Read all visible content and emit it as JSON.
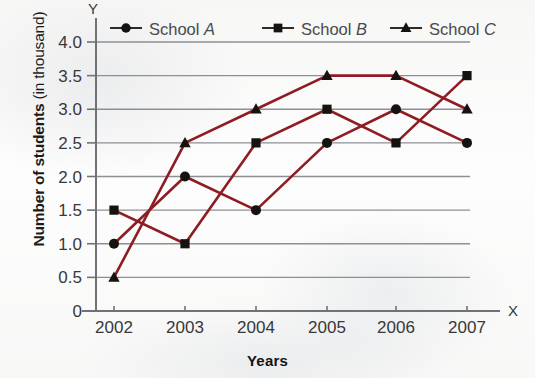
{
  "chart_data": {
    "type": "line",
    "title": "",
    "xlabel": "Years",
    "ylabel": "Number of students (in thousand)",
    "ylabel_bold_part": "Number of students",
    "ylabel_regular_part": "(in thousand)",
    "axis_letter_x": "X",
    "axis_letter_y": "Y",
    "categories": [
      "2002",
      "2003",
      "2004",
      "2005",
      "2006",
      "2007"
    ],
    "x": [
      2002,
      2003,
      2004,
      2005,
      2006,
      2007
    ],
    "ylim": [
      0,
      4.0
    ],
    "yticks": [
      0,
      0.5,
      1.0,
      1.5,
      2.0,
      2.5,
      3.0,
      3.5,
      4.0
    ],
    "ytick_labels": [
      "0",
      "0.5",
      "1.0",
      "1.5",
      "2.0",
      "2.5",
      "3.0",
      "3.5",
      "4.0"
    ],
    "grid": true,
    "grid_axis": "y",
    "legend_position": "top",
    "series": [
      {
        "name": "School A",
        "name_prefix": "School ",
        "name_italic": "A",
        "marker": "circle",
        "values": [
          1.0,
          2.0,
          1.5,
          2.5,
          3.0,
          2.5
        ]
      },
      {
        "name": "School B",
        "name_prefix": "School ",
        "name_italic": "B",
        "marker": "square",
        "values": [
          1.5,
          1.0,
          2.5,
          3.0,
          2.5,
          3.5
        ]
      },
      {
        "name": "School C",
        "name_prefix": "School ",
        "name_italic": "C",
        "marker": "triangle",
        "values": [
          0.5,
          2.5,
          3.0,
          3.5,
          3.5,
          3.0
        ]
      }
    ]
  },
  "style": {
    "line_color": "#8e1c23",
    "marker_color": "#16120f",
    "grid_color": "#8d8f93",
    "axis_color": "#6f7277",
    "tick_text_color": "#38383a",
    "legend_text_color": "#4a4a4c",
    "background": "#fbfbfa"
  },
  "geometry": {
    "plot_left": 96,
    "plot_right": 470,
    "plot_top": 42,
    "plot_bottom": 311,
    "x_positions": [
      114,
      185,
      256,
      327,
      396,
      467
    ],
    "y_axis_top": 18,
    "x_axis_right": 500
  }
}
